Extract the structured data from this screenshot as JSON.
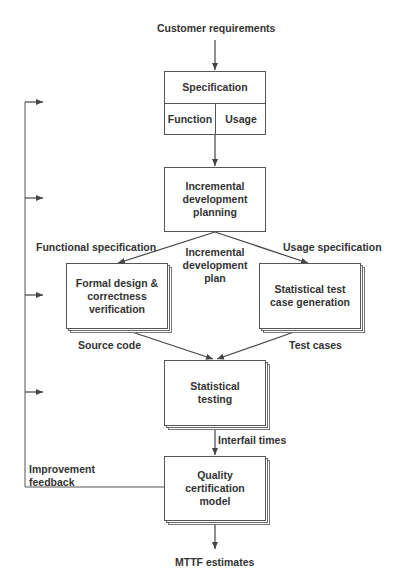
{
  "diagram": {
    "input_label": "Customer requirements",
    "specification": {
      "title": "Specification",
      "left_cell": "Function",
      "right_cell": "Usage"
    },
    "planning_box": "Incremental\ndevelopment\nplanning",
    "edge_labels": {
      "functional_specification": "Functional specification",
      "incremental_plan": "Incremental\ndevelopment\nplan",
      "usage_specification": "Usage specification",
      "source_code": "Source code",
      "test_cases": "Test cases",
      "interfail_times": "Interfail times",
      "improvement_feedback": "Improvement\nfeedback"
    },
    "formal_design_box": "Formal design &\ncorrectness\nverification",
    "test_generation_box": "Statistical test\ncase generation",
    "testing_box": "Statistical\ntesting",
    "certification_box": "Quality\ncertification\nmodel",
    "output_label": "MTTF estimates",
    "colors": {
      "line": "#444444",
      "text": "#333333",
      "background": "#ffffff"
    }
  }
}
